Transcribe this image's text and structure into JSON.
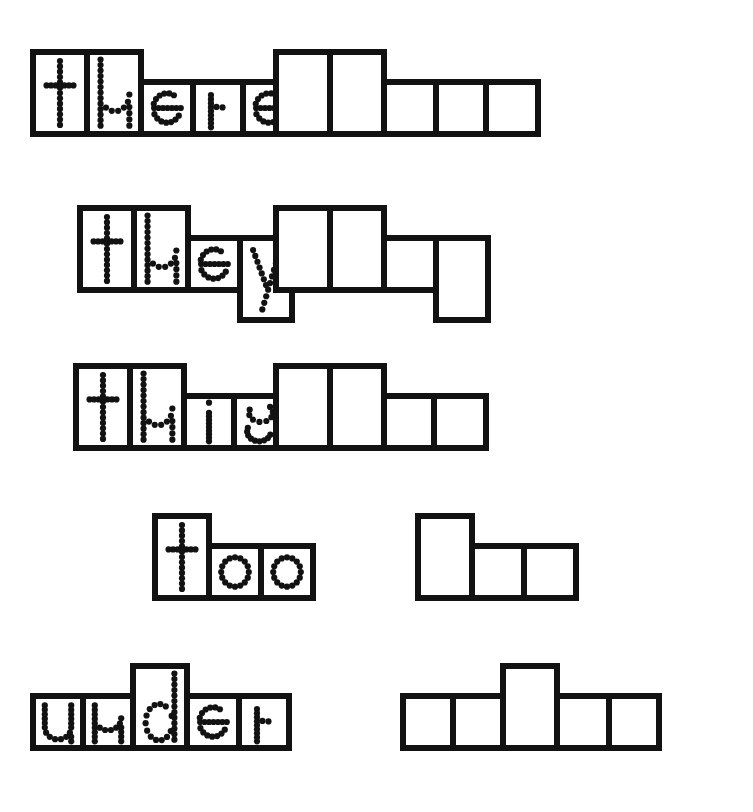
{
  "worksheet": {
    "title": "Word Shape Tracing Worksheet",
    "description": "Sight word shape boxes: trace the dotted word on the left, then write the word in the empty matching boxes on the right.",
    "background_color": "#ffffff",
    "ink_color": "#121212",
    "border_width_px": 6,
    "metrics": {
      "ascender_height": 88,
      "xheight_height": 58,
      "descender_extra": 30,
      "cell_width_tall": 60,
      "cell_width_short": 56
    },
    "rows": [
      {
        "word": "there",
        "row_top": 49,
        "baseline_y": 137,
        "traced_group_left": 30,
        "blank_group_left": 273,
        "letters": [
          {
            "char": "t",
            "kind": "ascender",
            "width": 60
          },
          {
            "char": "h",
            "kind": "ascender",
            "width": 60
          },
          {
            "char": "e",
            "kind": "xheight",
            "width": 58
          },
          {
            "char": "r",
            "kind": "xheight",
            "width": 56
          },
          {
            "char": "e",
            "kind": "xheight",
            "width": 58
          }
        ]
      },
      {
        "word": "they",
        "row_top": 205,
        "baseline_y": 293,
        "traced_group_left": 77,
        "blank_group_left": 273,
        "letters": [
          {
            "char": "t",
            "kind": "ascender",
            "width": 60
          },
          {
            "char": "h",
            "kind": "ascender",
            "width": 60
          },
          {
            "char": "e",
            "kind": "xheight",
            "width": 58
          },
          {
            "char": "y",
            "kind": "descender",
            "width": 58
          }
        ]
      },
      {
        "word": "this",
        "row_top": 363,
        "baseline_y": 451,
        "traced_group_left": 73,
        "blank_group_left": 273,
        "letters": [
          {
            "char": "t",
            "kind": "ascender",
            "width": 60
          },
          {
            "char": "h",
            "kind": "ascender",
            "width": 60
          },
          {
            "char": "i",
            "kind": "xheight",
            "width": 56
          },
          {
            "char": "s",
            "kind": "xheight",
            "width": 58
          }
        ]
      },
      {
        "word": "too",
        "row_top": 513,
        "baseline_y": 601,
        "traced_group_left": 152,
        "blank_group_left": 415,
        "letters": [
          {
            "char": "t",
            "kind": "ascender",
            "width": 60
          },
          {
            "char": "o",
            "kind": "xheight",
            "width": 58
          },
          {
            "char": "o",
            "kind": "xheight",
            "width": 58
          }
        ]
      },
      {
        "word": "under",
        "row_top": 663,
        "baseline_y": 751,
        "traced_group_left": 30,
        "blank_group_left": 400,
        "letters": [
          {
            "char": "u",
            "kind": "xheight",
            "width": 56
          },
          {
            "char": "n",
            "kind": "xheight",
            "width": 56
          },
          {
            "char": "d",
            "kind": "ascender",
            "width": 60
          },
          {
            "char": "e",
            "kind": "xheight",
            "width": 58
          },
          {
            "char": "r",
            "kind": "xheight",
            "width": 56
          }
        ]
      }
    ]
  }
}
